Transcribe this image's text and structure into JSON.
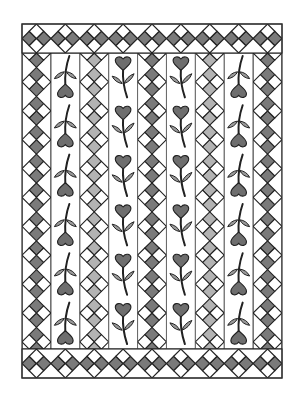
{
  "title": "Heart flower quilt pattern",
  "canvas": {
    "width": 299,
    "height": 396,
    "background": "#ffffff"
  },
  "frame": {
    "x": 22,
    "y": 24,
    "width": 260,
    "height": 354,
    "stroke": "#333333",
    "stroke_width": 1.2
  },
  "borders": {
    "band_height": 29,
    "top": {
      "y": 24
    },
    "bottom": {
      "y": 349
    },
    "diamond_count": 9,
    "side_fill": "#7a7a7a",
    "tip_fill": "#ffffff"
  },
  "body": {
    "y": 53,
    "height": 296,
    "column_count": 9
  },
  "colors": {
    "dark_gray": "#7a7a7a",
    "light_gray": "#b3b3b3",
    "heart_fill": "#6e6e6e",
    "leaf_fill": "#9a9a9a",
    "line": "#222222",
    "white": "#ffffff"
  },
  "columns": [
    {
      "index": 1,
      "type": "diamonds",
      "shade": "dark"
    },
    {
      "index": 2,
      "type": "hearts",
      "orientation": "down",
      "count": 6
    },
    {
      "index": 3,
      "type": "diamonds",
      "shade": "light"
    },
    {
      "index": 4,
      "type": "hearts",
      "orientation": "up",
      "count": 6
    },
    {
      "index": 5,
      "type": "diamonds",
      "shade": "dark"
    },
    {
      "index": 6,
      "type": "hearts",
      "orientation": "up",
      "count": 6
    },
    {
      "index": 7,
      "type": "diamonds",
      "shade": "light"
    },
    {
      "index": 8,
      "type": "hearts",
      "orientation": "down",
      "count": 6
    },
    {
      "index": 9,
      "type": "diamonds",
      "shade": "dark"
    }
  ]
}
